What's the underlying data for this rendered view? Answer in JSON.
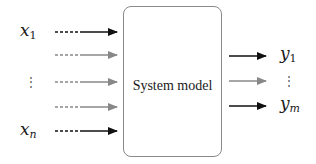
{
  "diagram": {
    "type": "block-diagram",
    "box": {
      "label": "System model"
    },
    "inputs": [
      {
        "label_base": "x",
        "label_sub": "1",
        "style": "black",
        "y": 32
      },
      {
        "label_base": "",
        "label_sub": "",
        "style": "gray",
        "y": 55
      },
      {
        "label_base": "⋮",
        "label_sub": "",
        "style": "gray",
        "y": 82
      },
      {
        "label_base": "",
        "label_sub": "",
        "style": "gray",
        "y": 107
      },
      {
        "label_base": "x",
        "label_sub": "n",
        "style": "black",
        "y": 131
      }
    ],
    "outputs": [
      {
        "label_base": "y",
        "label_sub": "1",
        "style": "black",
        "y": 56
      },
      {
        "label_base": "⋮",
        "label_sub": "",
        "style": "gray",
        "y": 81
      },
      {
        "label_base": "y",
        "label_sub": "m",
        "style": "black",
        "y": 106
      }
    ],
    "colors": {
      "black_arrow": "#111111",
      "gray_arrow": "#888888",
      "box_border": "#8a8a8a"
    }
  }
}
